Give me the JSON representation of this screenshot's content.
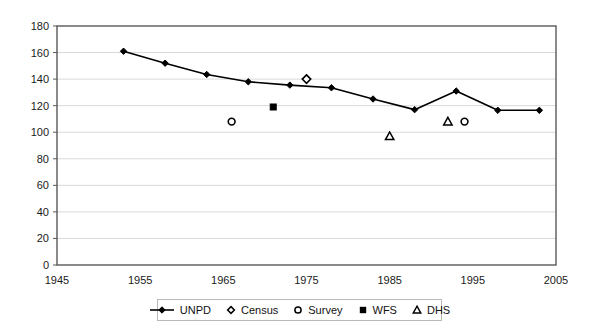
{
  "chart_data": {
    "type": "line",
    "title": "",
    "xlabel": "",
    "ylabel": "",
    "xlim": [
      1945,
      2005
    ],
    "ylim": [
      0,
      180
    ],
    "ytick_step": 20,
    "xtick_step": 10,
    "grid": true,
    "legend_position": "bottom",
    "x_ticks": [
      "1945",
      "1955",
      "1965",
      "1975",
      "1985",
      "1995",
      "2005"
    ],
    "y_ticks": [
      "0",
      "20",
      "40",
      "60",
      "80",
      "100",
      "120",
      "140",
      "160",
      "180"
    ],
    "series": [
      {
        "name": "UNPD",
        "marker": "filled-diamond",
        "line": true,
        "points": [
          {
            "x": 1953,
            "y": 161
          },
          {
            "x": 1958,
            "y": 152
          },
          {
            "x": 1963,
            "y": 143.5
          },
          {
            "x": 1968,
            "y": 138
          },
          {
            "x": 1973,
            "y": 135.5
          },
          {
            "x": 1978,
            "y": 133.5
          },
          {
            "x": 1983,
            "y": 125
          },
          {
            "x": 1988,
            "y": 117
          },
          {
            "x": 1993,
            "y": 131
          },
          {
            "x": 1998,
            "y": 116.5
          },
          {
            "x": 2003,
            "y": 116.5
          }
        ]
      },
      {
        "name": "Census",
        "marker": "open-diamond",
        "line": false,
        "points": [
          {
            "x": 1975,
            "y": 140
          }
        ]
      },
      {
        "name": "Survey",
        "marker": "open-circle",
        "line": false,
        "points": [
          {
            "x": 1966,
            "y": 108
          },
          {
            "x": 1994,
            "y": 108
          }
        ]
      },
      {
        "name": "WFS",
        "marker": "filled-square",
        "line": false,
        "points": [
          {
            "x": 1971,
            "y": 119
          }
        ]
      },
      {
        "name": "DHS",
        "marker": "open-triangle",
        "line": false,
        "points": [
          {
            "x": 1985,
            "y": 97
          },
          {
            "x": 1992,
            "y": 108
          }
        ]
      }
    ]
  },
  "legend": {
    "items": [
      {
        "label": "UNPD",
        "marker": "line-filled-diamond"
      },
      {
        "label": "Census",
        "marker": "open-diamond"
      },
      {
        "label": "Survey",
        "marker": "open-circle"
      },
      {
        "label": "WFS",
        "marker": "filled-square"
      },
      {
        "label": "DHS",
        "marker": "open-triangle"
      }
    ]
  },
  "colors": {
    "series_line": "#000000",
    "axis": "#595959",
    "grid": "#d9d9d9",
    "text": "#1a1a1a",
    "background": "#ffffff"
  }
}
